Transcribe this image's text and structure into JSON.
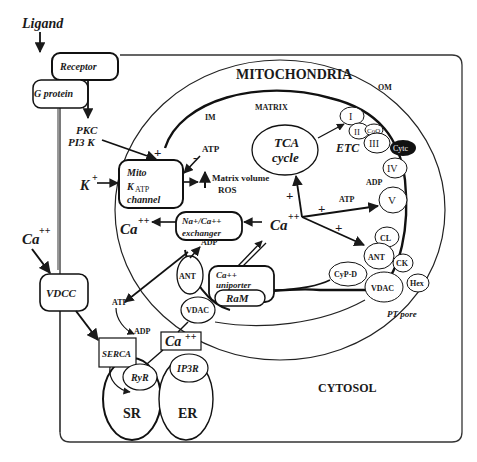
{
  "labels": {
    "ligand": "Ligand",
    "receptor": "Receptor",
    "g_protein": "G protein",
    "pkc": "PKC",
    "pi3k": "PI3 K",
    "mitochondria": "MITOCHONDRIA",
    "matrix": "MATRIX",
    "om": "OM",
    "im": "IM",
    "tca_line1": "TCA",
    "tca_line2": "cycle",
    "etc": "ETC",
    "complex_i": "I",
    "complex_ii": "II",
    "coq": "CoQ",
    "complex_iii": "III",
    "cytc": "Cytc",
    "complex_iv": "IV",
    "complex_v": "V",
    "adp_v": "ADP",
    "atp_v": "ATP",
    "mito_katp_line1": "Mito",
    "mito_katp_line2": "K",
    "mito_katp_sub": "ATP",
    "mito_katp_line3": "channel",
    "atp_inhib": "ATP",
    "minus": "-",
    "plus": "+",
    "k_ion": "K",
    "k_sup": "+",
    "matrix_volume": "Matrix volume",
    "ros": "ROS",
    "nacax_line1": "Na+/Ca++",
    "nacax_line2": "exchanger",
    "ca_left": "Ca",
    "ca_left_sup": "++",
    "ca_matrix": "Ca",
    "ca_matrix_sup": "++",
    "ant_left": "ANT",
    "adp_ant": "ADP",
    "uniporter_line1": "Ca++",
    "uniporter_line2": "uniporter",
    "ram": "RaM",
    "vdac_left": "VDAC",
    "atp_cyto": "ATP",
    "adp_serca": "ADP",
    "ca_cyto": "Ca",
    "ca_cyto_sup": "++",
    "serca": "SERCA",
    "ryr": "RyR",
    "ip3r": "IP3R",
    "sr": "SR",
    "er": "ER",
    "cl": "CL",
    "ant_right": "ANT",
    "ck": "CK",
    "cypd": "CyP-D",
    "vdac_right": "VDAC",
    "hex": "Hex",
    "pt_pore": "PT pore",
    "ca_ext": "Ca",
    "ca_ext_sup": "++",
    "vdcc": "VDCC",
    "cytosol": "CYTOSOL"
  },
  "colors": {
    "stroke": "#1a1a1a",
    "cytc_fill": "#111111",
    "background": "#ffffff"
  }
}
